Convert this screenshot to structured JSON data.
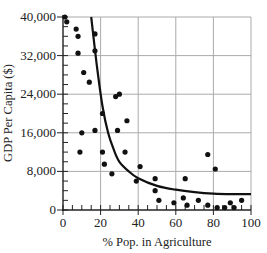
{
  "chart_data": {
    "type": "scatter",
    "title": "",
    "xlabel": "% Pop. in Agriculture",
    "ylabel": "GDP Per Capita ($)",
    "xlim": [
      0,
      100
    ],
    "ylim": [
      0,
      40000
    ],
    "grid": true,
    "legend": null,
    "x_ticks": [
      0,
      20,
      40,
      60,
      80,
      100
    ],
    "x_tick_labels": [
      "0",
      "20",
      "40",
      "60",
      "80",
      "100"
    ],
    "y_ticks": [
      0,
      8000,
      16000,
      24000,
      32000,
      40000
    ],
    "y_tick_labels": [
      "0",
      "8,000",
      "16,000",
      "24,000",
      "32,000",
      "40,000"
    ],
    "series": [
      {
        "name": "countries",
        "kind": "points",
        "points": [
          [
            1,
            40000
          ],
          [
            2,
            39000
          ],
          [
            7,
            37500
          ],
          [
            8,
            36000
          ],
          [
            8,
            32500
          ],
          [
            17,
            36500
          ],
          [
            17,
            33000
          ],
          [
            11,
            28500
          ],
          [
            14,
            26500
          ],
          [
            10,
            16000
          ],
          [
            9,
            12000
          ],
          [
            17,
            16500
          ],
          [
            21,
            12000
          ],
          [
            22,
            9500
          ],
          [
            21,
            20000
          ],
          [
            26,
            7500
          ],
          [
            29,
            16500
          ],
          [
            33,
            12000
          ],
          [
            28,
            23500
          ],
          [
            30,
            24000
          ],
          [
            34,
            18500
          ],
          [
            39,
            6000
          ],
          [
            41,
            9000
          ],
          [
            49,
            6500
          ],
          [
            49,
            4000
          ],
          [
            51,
            2000
          ],
          [
            59,
            1500
          ],
          [
            64,
            2500
          ],
          [
            65,
            6500
          ],
          [
            66,
            1000
          ],
          [
            72,
            2000
          ],
          [
            77,
            11500
          ],
          [
            77,
            1000
          ],
          [
            81,
            8500
          ],
          [
            82,
            500
          ],
          [
            86,
            500
          ],
          [
            89,
            1500
          ],
          [
            91,
            500
          ],
          [
            95,
            2000
          ]
        ]
      },
      {
        "name": "trend",
        "kind": "curve",
        "points": [
          [
            15,
            40000
          ],
          [
            18,
            30000
          ],
          [
            21,
            21500
          ],
          [
            24,
            16000
          ],
          [
            27,
            12500
          ],
          [
            30,
            10000
          ],
          [
            35,
            8000
          ],
          [
            40,
            6600
          ],
          [
            50,
            5000
          ],
          [
            60,
            4200
          ],
          [
            70,
            3700
          ],
          [
            80,
            3400
          ],
          [
            90,
            3300
          ],
          [
            100,
            3300
          ]
        ]
      }
    ]
  }
}
